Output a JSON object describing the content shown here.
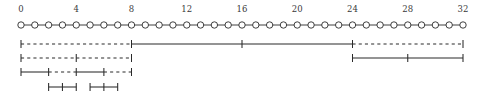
{
  "figure": {
    "title": "",
    "width": 484,
    "height": 99,
    "background_color": "#ffffff",
    "line_color": "#2a2a2a",
    "text_color": "#3a3a3a",
    "marker_fill_color": "#ffffff"
  },
  "chart_data": {
    "type": "line",
    "title": "",
    "xlabel": "",
    "ylabel": "",
    "xlim": [
      0,
      32
    ],
    "grid": false,
    "legend": null,
    "axis": {
      "name": "interval-scale",
      "tick_labels": [
        "0",
        "4",
        "8",
        "12",
        "16",
        "20",
        "24",
        "28",
        "32"
      ],
      "tick_values": [
        0,
        4,
        8,
        12,
        16,
        20,
        24,
        28,
        32
      ],
      "marker_positions": [
        0,
        1,
        2,
        3,
        4,
        5,
        6,
        7,
        8,
        9,
        10,
        11,
        12,
        13,
        14,
        15,
        16,
        17,
        18,
        19,
        20,
        21,
        22,
        23,
        24,
        25,
        26,
        27,
        28,
        29,
        30,
        31,
        32
      ],
      "marker_count": 33,
      "marker_shape": "circle"
    },
    "series": [
      {
        "name": "row-1",
        "row": 1,
        "caps": [
          0,
          32
        ],
        "ticks": [
          8,
          16,
          24
        ],
        "segments": [
          {
            "start": 0,
            "end": 8,
            "style": "dashed"
          },
          {
            "start": 8,
            "end": 24,
            "style": "solid"
          },
          {
            "start": 24,
            "end": 32,
            "style": "dashed"
          }
        ]
      },
      {
        "name": "row-2",
        "row": 2,
        "caps": [
          0,
          8,
          24,
          32
        ],
        "ticks": [
          4,
          28
        ],
        "segments": [
          {
            "start": 0,
            "end": 4,
            "style": "dashed"
          },
          {
            "start": 4,
            "end": 8,
            "style": "dashed"
          },
          {
            "start": 24,
            "end": 28,
            "style": "solid"
          },
          {
            "start": 28,
            "end": 32,
            "style": "solid"
          }
        ]
      },
      {
        "name": "row-3",
        "row": 3,
        "caps": [
          0,
          8
        ],
        "ticks": [
          2,
          4,
          6
        ],
        "segments": [
          {
            "start": 0,
            "end": 2,
            "style": "solid"
          },
          {
            "start": 2,
            "end": 4,
            "style": "dashed"
          },
          {
            "start": 4,
            "end": 6,
            "style": "solid"
          },
          {
            "start": 6,
            "end": 8,
            "style": "dashed"
          }
        ]
      },
      {
        "name": "row-4",
        "row": 4,
        "caps": [
          2,
          4,
          5,
          7
        ],
        "ticks": [
          3,
          6
        ],
        "segments": [
          {
            "start": 2,
            "end": 4,
            "style": "solid"
          },
          {
            "start": 5,
            "end": 7,
            "style": "solid"
          }
        ]
      }
    ],
    "geometry": {
      "x_origin_px": 21,
      "x_end_px": 463,
      "label_baseline_y_px": 12,
      "axis_y_px": 25,
      "marker_radius_px": 3.2,
      "row_y_px": [
        44,
        58,
        72,
        87
      ],
      "cap_half_height_px": 4.0,
      "tick_half_height_px": 4.0
    }
  }
}
